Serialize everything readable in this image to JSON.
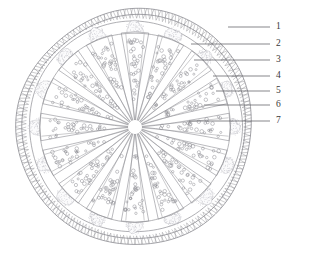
{
  "figure": {
    "type": "anatomical-cross-section",
    "title": "",
    "background_color": "#ffffff",
    "line_color": "#8c8c92",
    "label_color": "#3a3a3a",
    "stipple_color": "#b9b9c0",
    "geometry": {
      "center_x": 135,
      "center_y": 127,
      "outer_band_outer_radius": 118,
      "outer_band_inner_radius": 112,
      "capsule_radius": 106,
      "inner_circle_radius": 95,
      "hub_radius": 7,
      "wedge_count": 16,
      "ray_count": 32
    }
  },
  "labels": [
    {
      "id": "1",
      "text": "1",
      "text_x": 276,
      "text_y": 27,
      "line_x1": 228,
      "line_y1": 27,
      "line_x2": 270,
      "line_y2": 27
    },
    {
      "id": "2",
      "text": "2",
      "text_x": 276,
      "text_y": 44,
      "line_x1": 191,
      "line_y1": 44,
      "line_x2": 270,
      "line_y2": 44
    },
    {
      "id": "3",
      "text": "3",
      "text_x": 276,
      "text_y": 60,
      "line_x1": 194,
      "line_y1": 60,
      "line_x2": 270,
      "line_y2": 60
    },
    {
      "id": "4",
      "text": "4",
      "text_x": 276,
      "text_y": 76,
      "line_x1": 213,
      "line_y1": 76,
      "line_x2": 270,
      "line_y2": 76
    },
    {
      "id": "5",
      "text": "5",
      "text_x": 276,
      "text_y": 91,
      "line_x1": 216,
      "line_y1": 91,
      "line_x2": 270,
      "line_y2": 91
    },
    {
      "id": "6",
      "text": "6",
      "text_x": 276,
      "text_y": 105,
      "line_x1": 204,
      "line_y1": 105,
      "line_x2": 270,
      "line_y2": 105
    },
    {
      "id": "7",
      "text": "7",
      "text_x": 276,
      "text_y": 121,
      "line_x1": 189,
      "line_y1": 121,
      "line_x2": 270,
      "line_y2": 121
    }
  ],
  "structures": {
    "outer_band": "braided cross-hatched outer ring",
    "capsule_outline": "smooth outer capsule wall",
    "inner_circle": "inner circular boundary",
    "wedges": "radiating wedge-shaped segments with stippled dot fill",
    "tip_caps": "stippled cloud-like caps at outer wedge tips",
    "hub": "central hub where all rays converge"
  }
}
